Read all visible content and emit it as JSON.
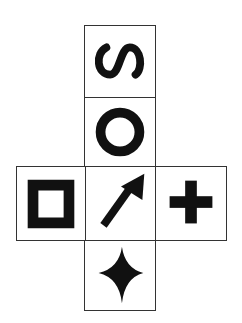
{
  "figure": {
    "type": "cube-net",
    "faces": [
      {
        "id": "top",
        "symbol": "letter-S-rotated",
        "label": "S"
      },
      {
        "id": "upper-middle",
        "symbol": "ring",
        "label": "O"
      },
      {
        "id": "left",
        "symbol": "hollow-square",
        "label": "square outline"
      },
      {
        "id": "center",
        "symbol": "diagonal-arrow",
        "label": "arrow pointing up-right"
      },
      {
        "id": "right",
        "symbol": "plus",
        "label": "+"
      },
      {
        "id": "bottom",
        "symbol": "four-point-star",
        "label": "four-pointed star"
      }
    ],
    "colors": {
      "ink": "#111111",
      "border": "#333333",
      "background": "#ffffff"
    }
  }
}
